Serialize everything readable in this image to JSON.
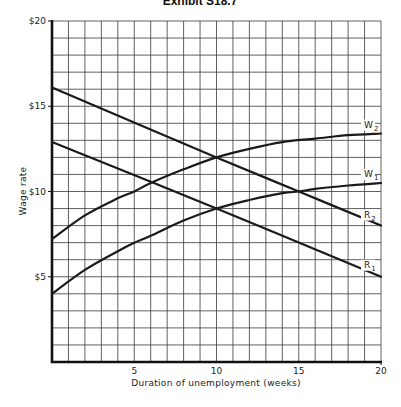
{
  "chart_data": {
    "type": "line",
    "title": "Exhibit S18.7",
    "xlabel": "Duration of unemployment (weeks)",
    "ylabel": "Wage rate",
    "xlim": [
      0,
      20
    ],
    "ylim": [
      0,
      20
    ],
    "x_ticks": [
      5,
      10,
      15,
      20
    ],
    "x_tick_labels": [
      "5",
      "10",
      "15",
      "20"
    ],
    "y_ticks": [
      5,
      10,
      15,
      20
    ],
    "y_tick_labels": [
      "$5",
      "$10",
      "$15",
      "$20"
    ],
    "grid": true,
    "grid_x_step": 1,
    "grid_y_step": 1,
    "legend": "inline labels at right end of each curve",
    "series": [
      {
        "name": "W2",
        "label_main": "W",
        "label_sub": "2",
        "x": [
          0,
          2,
          4,
          5,
          6,
          8,
          10,
          12,
          14,
          16,
          18,
          20
        ],
        "values": [
          7.2,
          8.6,
          9.6,
          10.0,
          10.5,
          11.3,
          12.0,
          12.5,
          12.9,
          13.1,
          13.3,
          13.4
        ]
      },
      {
        "name": "W1",
        "label_main": "W",
        "label_sub": "1",
        "x": [
          0,
          2,
          4,
          5,
          6,
          8,
          10,
          12,
          14,
          15,
          16,
          18,
          20
        ],
        "values": [
          4.0,
          5.4,
          6.5,
          7.0,
          7.4,
          8.3,
          9.0,
          9.5,
          9.9,
          10.0,
          10.15,
          10.35,
          10.5
        ]
      },
      {
        "name": "R2",
        "label_main": "R",
        "label_sub": "2",
        "x": [
          0,
          10,
          15,
          20
        ],
        "values": [
          16.1,
          12.0,
          10.0,
          8.0
        ]
      },
      {
        "name": "R1",
        "label_main": "R",
        "label_sub": "1",
        "x": [
          0,
          10,
          20
        ],
        "values": [
          12.9,
          9.0,
          5.0
        ]
      }
    ]
  }
}
